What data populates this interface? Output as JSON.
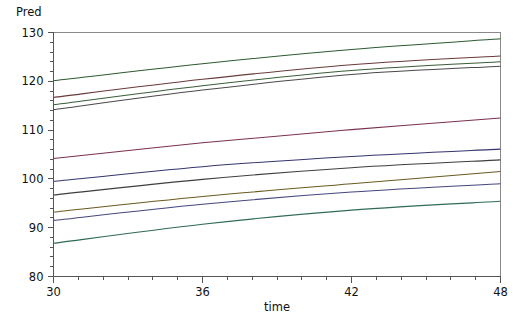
{
  "chart_data": {
    "type": "line",
    "title": "",
    "corner_label": "Pred",
    "ylabel": "Pred",
    "xlabel": "time",
    "xlim": [
      30,
      48
    ],
    "ylim": [
      80,
      130
    ],
    "grid": false,
    "legend": "none",
    "x_ticks": [
      30,
      36,
      42,
      48
    ],
    "x_tick_labels": [
      "30",
      "36",
      "42",
      "48"
    ],
    "x_minor_count": 6,
    "y_ticks": [
      80,
      90,
      100,
      110,
      120,
      130
    ],
    "y_tick_labels": [
      "80",
      "90",
      "100",
      "110",
      "120",
      "130"
    ],
    "y_minor_count": 5,
    "x": [
      30,
      36,
      42,
      48
    ],
    "series": [
      {
        "name": "curve-01",
        "color": "#3d3d7a",
        "values": [
          130.9,
          133.6,
          136.2,
          138.4
        ]
      },
      {
        "name": "curve-02",
        "color": "#2f5a33",
        "values": [
          120.1,
          123.6,
          126.5,
          128.7
        ]
      },
      {
        "name": "curve-03",
        "color": "#6b3a3a",
        "values": [
          116.7,
          120.4,
          123.4,
          125.2
        ]
      },
      {
        "name": "curve-04",
        "color": "#3a5d3a",
        "values": [
          115.2,
          119.1,
          122.2,
          124.0
        ]
      },
      {
        "name": "curve-05",
        "color": "#4a4a4a",
        "values": [
          114.2,
          118.2,
          121.4,
          123.1
        ]
      },
      {
        "name": "curve-06",
        "color": "#7a3050",
        "values": [
          104.2,
          107.4,
          110.1,
          112.5
        ]
      },
      {
        "name": "curve-07",
        "color": "#35356e",
        "values": [
          99.5,
          102.5,
          104.6,
          106.1
        ]
      },
      {
        "name": "curve-08",
        "color": "#3f3f3f",
        "values": [
          96.7,
          99.9,
          102.3,
          103.9
        ]
      },
      {
        "name": "curve-09",
        "color": "#6a5a20",
        "values": [
          93.2,
          96.4,
          99.0,
          101.5
        ]
      },
      {
        "name": "curve-10",
        "color": "#46467f",
        "values": [
          91.5,
          94.8,
          97.3,
          99.0
        ]
      },
      {
        "name": "curve-11",
        "color": "#2f6a5a",
        "values": [
          86.8,
          90.7,
          93.6,
          95.4
        ]
      },
      {
        "name": "curve-12",
        "color": "#4d7a4d",
        "values": [
          79.6,
          79.4,
          79.3,
          79.2
        ]
      }
    ],
    "annotations": []
  },
  "axes": {
    "y_axis_name": "Pred",
    "x_axis_name": "time"
  }
}
